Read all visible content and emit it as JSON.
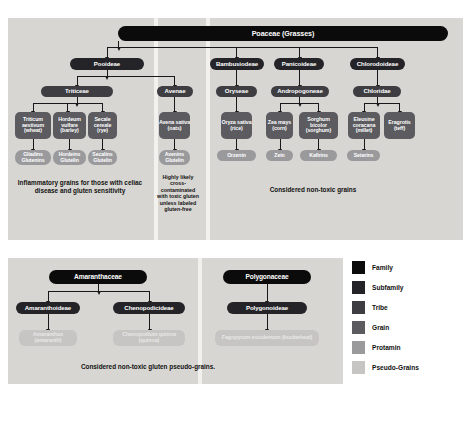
{
  "top_panel": {
    "family": {
      "label": "Poaceae (Grasses)"
    },
    "subfamilies": [
      {
        "label": "Pooideae"
      },
      {
        "label": "Bambusiodeae"
      },
      {
        "label": "Panicoideae"
      },
      {
        "label": "Chlorodoideae"
      }
    ],
    "tribes": [
      {
        "label": "Triticeae"
      },
      {
        "label": "Avenae"
      },
      {
        "label": "Oryseae"
      },
      {
        "label": "Andropogoneae"
      },
      {
        "label": "Chloridae"
      }
    ],
    "grains": [
      {
        "label": "Triticum aestivum (wheat)"
      },
      {
        "label": "Hordeum vulfare (barley)"
      },
      {
        "label": "Secale cereale (rye)"
      },
      {
        "label": "Avena sativa (oats)"
      },
      {
        "label": "Oryza sativa (rice)"
      },
      {
        "label": "Zea mays (corn)"
      },
      {
        "label": "Sorghum bicolor (sorghum)"
      },
      {
        "label": "Eleusine coracana (millet)"
      },
      {
        "label": "Eragrotis (teff)"
      }
    ],
    "protamins": [
      {
        "label": "Gliadins Glutenins"
      },
      {
        "label": "Hordeins Glutelin"
      },
      {
        "label": "Secalins Glutelin"
      },
      {
        "label": "Avenins Glutelin"
      },
      {
        "label": "Orzenin"
      },
      {
        "label": "Zein"
      },
      {
        "label": "Kafirins"
      },
      {
        "label": "Setarins"
      }
    ],
    "captions": [
      {
        "text": "Inflammatory grains for those with celiac disease and gluten sensitivity"
      },
      {
        "text": "Highly likely cross-contaminated with toxic gluten unless labeled gluten-free"
      },
      {
        "text": "Considered non-toxic grains"
      }
    ]
  },
  "bottom_panel": {
    "families": [
      {
        "label": "Amaranthaceae"
      },
      {
        "label": "Polygonaceae"
      }
    ],
    "subfamilies": [
      {
        "label": "Amaranthoideae"
      },
      {
        "label": "Chenopodicideae"
      },
      {
        "label": "Polygonoideae"
      }
    ],
    "pseudo_grains": [
      {
        "label": "Amaranthus (amaranth)"
      },
      {
        "label": "Chenopodium quinoa (quinoa)"
      },
      {
        "label": "Fagopyrum esculentum (buckwheat)"
      }
    ],
    "caption": {
      "text": "Considered non-toxic gluten pseudo-grains."
    }
  },
  "legend": {
    "items": [
      {
        "label": "Family",
        "color": "#0b0b0c"
      },
      {
        "label": "Subfamily",
        "color": "#242428"
      },
      {
        "label": "Tribe",
        "color": "#3d3d42"
      },
      {
        "label": "Grain",
        "color": "#5b5b60"
      },
      {
        "label": "Protamin",
        "color": "#9a9a9d"
      },
      {
        "label": "Pseudo-Grains",
        "color": "#c6c5c3"
      }
    ]
  }
}
